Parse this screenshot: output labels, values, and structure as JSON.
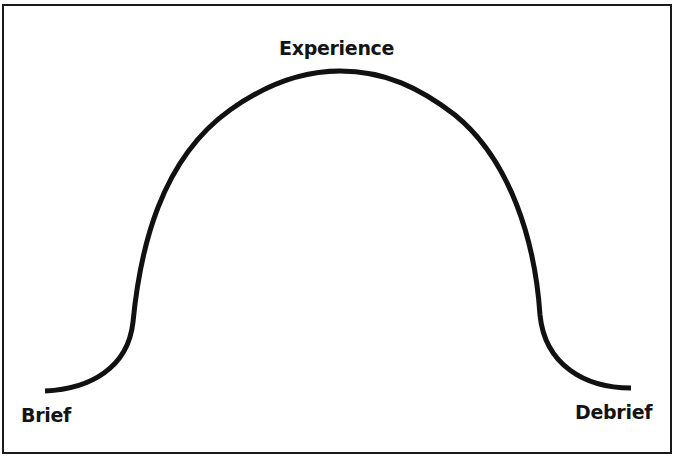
{
  "diagram": {
    "type": "bell-curve",
    "labels": {
      "peak": "Experience",
      "start": "Brief",
      "end": "Debrief"
    },
    "stroke_color": "#111111",
    "border_color": "#1a1a1a"
  }
}
